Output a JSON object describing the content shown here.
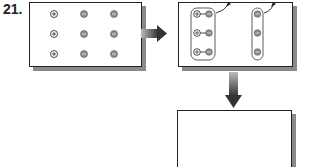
{
  "question": {
    "number": "21.",
    "answer_text": "; 0"
  },
  "panels": [
    {
      "name": "initial-state",
      "ions": {
        "positive_count": 3,
        "negative_count": 6
      }
    },
    {
      "name": "paired-state",
      "pairs": 3,
      "free_negative_column": 3
    },
    {
      "name": "empty-result-box"
    }
  ],
  "colors": {
    "negative_fill": "#8c8c8c",
    "outline": "#222222",
    "shadow": "#8a8a8a"
  }
}
